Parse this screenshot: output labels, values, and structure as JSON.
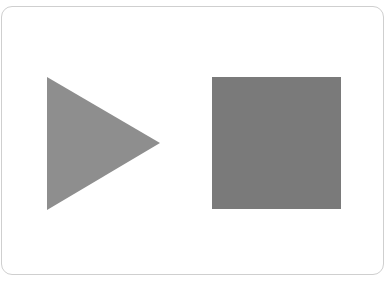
{
  "controls": {
    "play": {
      "icon": "play-icon",
      "color": "#8e8e8e"
    },
    "stop": {
      "icon": "stop-icon",
      "color": "#7a7a7a"
    }
  },
  "colors": {
    "background": "#ffffff",
    "frame_border": "#cfcfcf"
  }
}
